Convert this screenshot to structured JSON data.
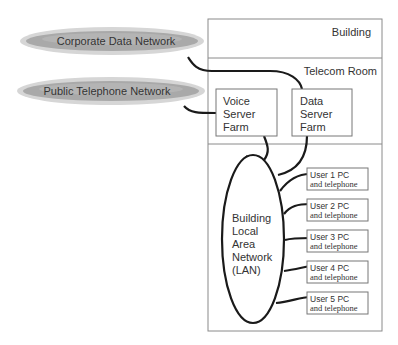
{
  "networks": {
    "corporate": {
      "label": "Corporate Data Network"
    },
    "public": {
      "label": "Public Telephone Network"
    }
  },
  "building": {
    "label": "Building",
    "telecom_room": {
      "label": "Telecom Room",
      "voice_farm": {
        "line1": "Voice",
        "line2": "Server",
        "line3": "Farm"
      },
      "data_farm": {
        "line1": "Data",
        "line2": "Server",
        "line3": "Farm"
      }
    },
    "lan": {
      "line1": "Building",
      "line2": "Local",
      "line3": "Area",
      "line4": "Network",
      "line5": "(LAN)"
    },
    "users": [
      {
        "line1": "User 1 PC",
        "line2": "and telephone"
      },
      {
        "line1": "User 2 PC",
        "line2": "and telephone"
      },
      {
        "line1": "User 3 PC",
        "line2": "and telephone"
      },
      {
        "line1": "User 4 PC",
        "line2": "and telephone"
      },
      {
        "line1": "User 5 PC",
        "line2": "and telephone"
      }
    ]
  },
  "colors": {
    "line": "#1a1a1a",
    "box_border": "#888888",
    "oval_dark": "#8c8c8c",
    "oval_light": "#d9d9d9"
  }
}
